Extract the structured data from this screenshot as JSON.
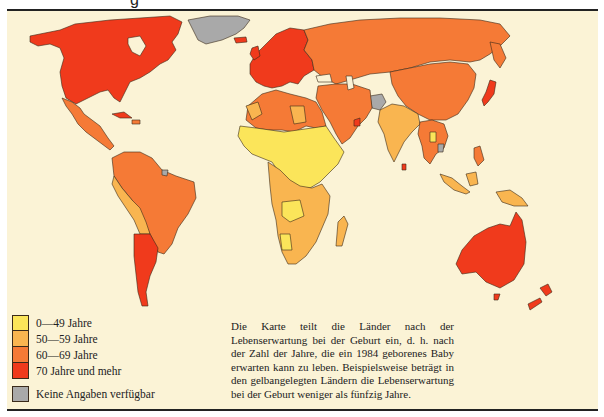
{
  "header": {
    "clipped_glyph": "g"
  },
  "legend": {
    "items": [
      {
        "label": "0—49 Jahre",
        "color": "#fbe55a"
      },
      {
        "label": "50—59 Jahre",
        "color": "#f9b550"
      },
      {
        "label": "60—69 Jahre",
        "color": "#f57a36"
      },
      {
        "label": "70 Jahre und mehr",
        "color": "#f03a1c"
      }
    ],
    "no_data": {
      "label": "Keine Angaben verfügbar",
      "color": "#a9a9a9"
    }
  },
  "caption": {
    "text": "Die Karte teilt die Länder nach der Lebenserwartung bei der Geburt ein, d. h. nach der Zahl der Jahre, die ein 1984 geborenes Baby erwarten kann zu leben. Beispielsweise beträgt in den gelbangelegten Ländern die Lebenserwartung bei der Geburt weniger als fünfzig Jahre."
  },
  "map": {
    "title_year": "1984",
    "background": "#fbf3d6",
    "regions": {
      "north_america": "70 Jahre und mehr",
      "greenland": "Keine Angaben verfügbar",
      "mexico_central_america": "60—69 Jahre",
      "south_america_north": "60—69 Jahre",
      "peru_bolivia": "50—59 Jahre",
      "argentina_chile": "70 Jahre und mehr",
      "europe": "70 Jahre und mehr",
      "soviet_union": "60—69 Jahre",
      "china_mongolia": "60—69 Jahre",
      "japan": "70 Jahre und mehr",
      "north_africa": "60—69 Jahre",
      "sahel_central_africa": "0—49 Jahre",
      "southern_africa": "50—59 Jahre",
      "middle_east": "60—69 Jahre",
      "afghanistan": "Keine Angaben verfügbar",
      "india_south_asia": "50—59 Jahre",
      "southeast_asia": "60—69 Jahre",
      "indonesia": "50—59 Jahre",
      "australia_new_zealand": "70 Jahre und mehr"
    }
  }
}
